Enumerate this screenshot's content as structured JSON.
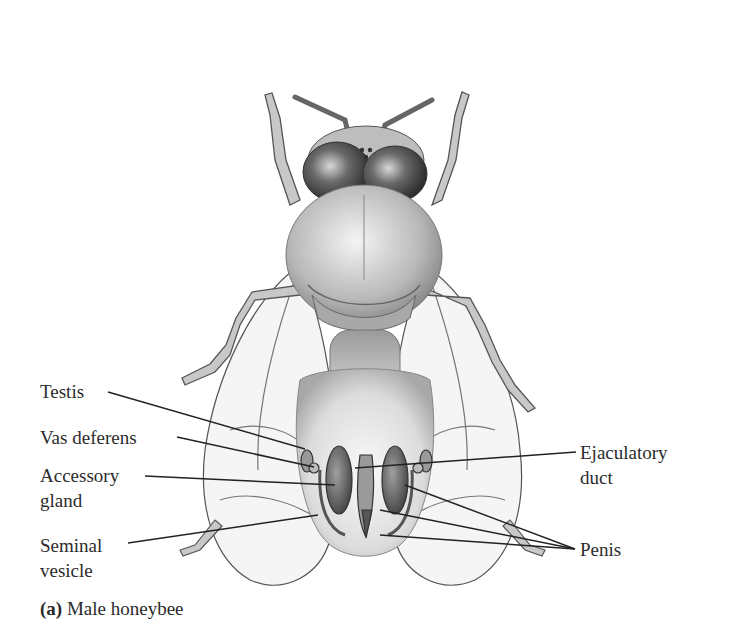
{
  "figure": {
    "caption": {
      "panel": "(a)",
      "text": "Male honeybee"
    },
    "labels": {
      "testis": "Testis",
      "vas_deferens": "Vas deferens",
      "accessory_gland_1": "Accessory",
      "accessory_gland_2": "gland",
      "seminal_vesicle_1": "Seminal",
      "seminal_vesicle_2": "vesicle",
      "ejaculatory_duct_1": "Ejaculatory",
      "ejaculatory_duct_2": "duct",
      "penis": "Penis"
    },
    "colors": {
      "ink": "#2b2b2b",
      "body_light": "#d9d9d9",
      "body_dark": "#6e6e6e",
      "wing": "#f2f2f2"
    }
  }
}
